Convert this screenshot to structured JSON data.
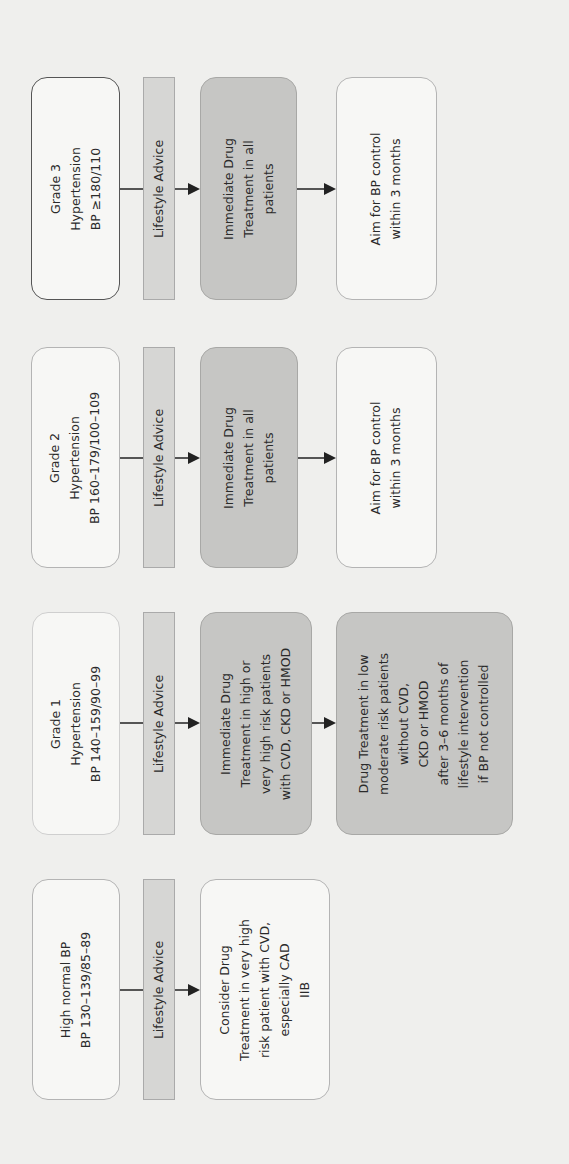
{
  "diagram": {
    "orientation": "rotated-90-ccw",
    "colors": {
      "background": "#efefed",
      "box_fill": "#f7f7f5",
      "shaded_fill": "#c6c6c4",
      "lifestyle_bar_fill": "#d6d6d4",
      "arrow": "#222222"
    },
    "columns": [
      {
        "id": "grade3",
        "label": "Grade 3\nHypertension\nBP ≥180/110",
        "lifestyle": "Lifestyle Advice",
        "treatment": "Immediate Drug\nTreatment in all\npatients",
        "outcome": "Aim for BP control\nwithin 3 months"
      },
      {
        "id": "grade2",
        "label": "Grade 2\nHypertension\nBP 160–179/100–109",
        "lifestyle": "Lifestyle Advice",
        "treatment": "Immediate Drug\nTreatment in all\npatients",
        "outcome": "Aim for BP control\nwithin 3 months"
      },
      {
        "id": "grade1",
        "label": "Grade 1\nHypertension\nBP 140–159/90–99",
        "lifestyle": "Lifestyle Advice",
        "treatment": "Immediate Drug\nTreatment in high or\nvery high risk patients\nwith CVD, CKD or HMOD",
        "outcome": "Drug Treatment in low\nmoderate risk patients\nwithout CVD,\nCKD or HMOD\nafter 3–6 months of\nlifestyle intervention\nif BP not controlled"
      },
      {
        "id": "high-normal",
        "label": "High normal BP\nBP 130–139/85–89",
        "lifestyle": "Lifestyle Advice",
        "treatment": "Consider Drug\nTreatment in very high\nrisk patient with CVD,\nespecially CAD\nIIB"
      }
    ]
  }
}
